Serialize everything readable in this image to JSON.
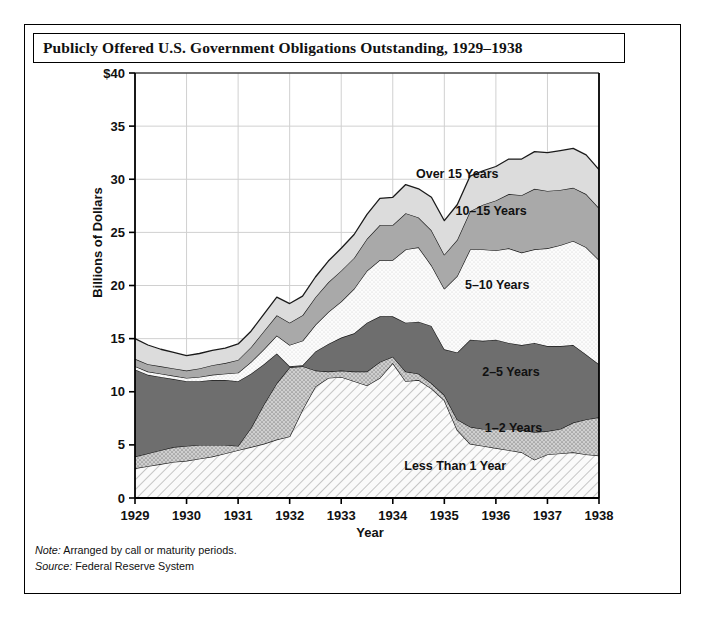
{
  "figure": {
    "title": "Publicly Offered U.S. Government Obligations Outstanding, 1929–1938",
    "note": "Note: Arranged by call or maturity periods.",
    "source": "Source: Federal Reserve System"
  },
  "notes": {
    "note_prefix": "Note:",
    "note_body": " Arranged by call or maturity periods.",
    "source_prefix": "Source:",
    "source_body": " Federal Reserve System"
  },
  "colors": {
    "over15": "#dcdcdc",
    "y10_15": "#a9a9a9",
    "y5_10": "#fbfbfb",
    "y2_5": "#6e6e6e",
    "y1_2": "#c8c8c8",
    "less1": "#f4f4f4",
    "stroke": "#1a1a1a",
    "grid": "#d0d0d0",
    "axis": "#000000"
  },
  "chart_data": {
    "type": "area",
    "stacked": true,
    "title": "Publicly Offered U.S. Government Obligations Outstanding, 1929–1938",
    "xlabel": "Year",
    "ylabel": "Billions of Dollars",
    "ylim": [
      0,
      40
    ],
    "yticks": [
      "0",
      "5",
      "10",
      "15",
      "20",
      "25",
      "30",
      "35",
      "$40"
    ],
    "ytick_values": [
      0,
      5,
      10,
      15,
      20,
      25,
      30,
      35,
      40
    ],
    "xlim": [
      1929,
      1938
    ],
    "xticks": [
      "1929",
      "1930",
      "1931",
      "1932",
      "1933",
      "1934",
      "1935",
      "1936",
      "1937",
      "1938"
    ],
    "xtick_values": [
      1929,
      1930,
      1931,
      1932,
      1933,
      1934,
      1935,
      1936,
      1937,
      1938
    ],
    "grid": true,
    "legend_position": "inline-band-labels",
    "x": [
      1929,
      1929.25,
      1929.5,
      1929.75,
      1930,
      1930.25,
      1930.5,
      1930.75,
      1931,
      1931.25,
      1931.5,
      1931.75,
      1932,
      1932.25,
      1932.5,
      1932.75,
      1933,
      1933.25,
      1933.5,
      1933.75,
      1934,
      1934.25,
      1934.5,
      1934.75,
      1935,
      1935.25,
      1935.5,
      1935.75,
      1936,
      1936.25,
      1936.5,
      1936.75,
      1937,
      1937.25,
      1937.5,
      1937.75,
      1938
    ],
    "series": [
      {
        "name": "Less Than 1 Year",
        "fill": "#f4f4f4",
        "pattern": "diagonal-hatch",
        "label": "Less Than 1 Year",
        "values": [
          2.8,
          3.0,
          3.2,
          3.4,
          3.5,
          3.7,
          3.9,
          4.2,
          4.5,
          4.8,
          5.1,
          5.5,
          5.8,
          8.3,
          10.5,
          11.3,
          11.4,
          11.0,
          10.6,
          11.3,
          12.7,
          11.0,
          11.1,
          10.3,
          9.2,
          6.4,
          5.1,
          4.9,
          4.7,
          4.5,
          4.3,
          3.6,
          4.1,
          4.2,
          4.3,
          4.1,
          4.0
        ]
      },
      {
        "name": "1–2 Years",
        "fill": "#c8c8c8",
        "pattern": "stipple",
        "label": "1–2 Years",
        "values": [
          1.1,
          1.2,
          1.3,
          1.4,
          1.4,
          1.3,
          1.1,
          0.8,
          0.4,
          1.8,
          3.7,
          5.3,
          6.5,
          4.1,
          1.5,
          0.6,
          0.6,
          0.9,
          1.3,
          1.5,
          0.6,
          0.9,
          0.6,
          0.5,
          0.5,
          1.0,
          1.6,
          1.6,
          1.8,
          2.0,
          2.1,
          2.6,
          2.2,
          2.3,
          2.8,
          3.3,
          3.6
        ]
      },
      {
        "name": "2–5 Years",
        "fill": "#6e6e6e",
        "pattern": "solid",
        "label": "2–5 Years",
        "values": [
          8.2,
          7.4,
          6.9,
          6.4,
          6.1,
          6.0,
          6.1,
          6.1,
          6.1,
          5.1,
          3.8,
          2.8,
          0.1,
          0.1,
          1.8,
          2.6,
          3.1,
          3.6,
          4.6,
          4.3,
          3.8,
          4.6,
          4.9,
          5.4,
          4.3,
          6.3,
          8.2,
          8.3,
          8.4,
          8.1,
          8.0,
          8.4,
          8.0,
          7.8,
          7.3,
          6.1,
          5.0
        ]
      },
      {
        "name": "5–10 Years",
        "fill": "#fbfbfb",
        "pattern": "dots",
        "label": "5–10 Years",
        "values": [
          0.3,
          0.3,
          0.3,
          0.3,
          0.3,
          0.4,
          0.5,
          0.6,
          0.8,
          1.1,
          1.4,
          1.7,
          2.0,
          2.3,
          2.5,
          3.0,
          3.4,
          4.2,
          4.9,
          5.3,
          5.3,
          6.9,
          7.0,
          5.7,
          5.7,
          7.2,
          8.5,
          8.6,
          8.4,
          8.9,
          8.7,
          8.8,
          9.2,
          9.5,
          9.8,
          10.1,
          9.8
        ]
      },
      {
        "name": "10–15 Years",
        "fill": "#a9a9a9",
        "pattern": "solid",
        "label": "10–15 Years",
        "values": [
          0.7,
          0.7,
          0.7,
          0.7,
          0.7,
          0.8,
          0.9,
          1.0,
          1.2,
          1.4,
          1.7,
          1.9,
          2.1,
          2.4,
          2.6,
          2.8,
          2.9,
          2.9,
          3.0,
          3.3,
          3.3,
          3.4,
          2.8,
          3.3,
          3.2,
          3.4,
          3.6,
          4.2,
          4.7,
          5.1,
          5.4,
          5.7,
          5.4,
          5.2,
          5.0,
          5.0,
          4.9
        ]
      },
      {
        "name": "Over 15 Years",
        "fill": "#dcdcdc",
        "pattern": "solid",
        "label": "Over 15 Years",
        "values": [
          1.9,
          1.8,
          1.6,
          1.5,
          1.4,
          1.4,
          1.4,
          1.4,
          1.5,
          1.5,
          1.6,
          1.7,
          1.8,
          1.8,
          1.9,
          2.0,
          2.1,
          2.2,
          2.3,
          2.5,
          2.6,
          2.7,
          2.7,
          3.1,
          3.2,
          3.3,
          3.3,
          3.2,
          3.2,
          3.3,
          3.4,
          3.5,
          3.6,
          3.7,
          3.7,
          3.7,
          3.6
        ]
      }
    ],
    "band_label_positions": [
      {
        "name": "Over 15 Years",
        "x": 1936.05,
        "y": 30.1
      },
      {
        "name": "10–15 Years",
        "x": 1936.6,
        "y": 26.6
      },
      {
        "name": "5–10 Years",
        "x": 1936.65,
        "y": 19.7
      },
      {
        "name": "2–5 Years",
        "x": 1936.85,
        "y": 11.5
      },
      {
        "name": "1–2 Years",
        "x": 1936.9,
        "y": 6.2
      },
      {
        "name": "Less Than 1 Year",
        "x": 1936.2,
        "y": 2.6
      }
    ]
  }
}
